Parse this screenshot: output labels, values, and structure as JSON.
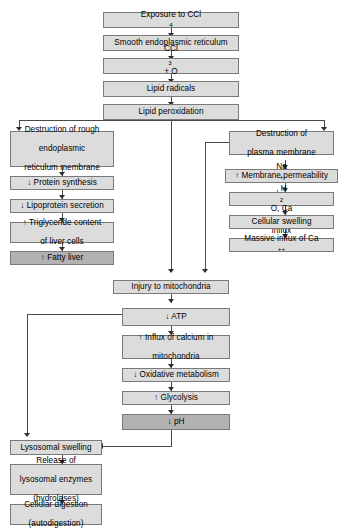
{
  "diagram": {
    "colors": {
      "box_fill": "#dcdcdc",
      "box_fill_highlight": "#b2b2b2",
      "box_border": "#7a7a7a",
      "connector": "#4a4a4a",
      "background": "#ffffff",
      "text": "#000000"
    },
    "nodes": {
      "exposure": {
        "label": "Exposure to CCl",
        "sub": "4",
        "highlight": false
      },
      "smooth_er": {
        "label": "Smooth endoplasmic reticulum",
        "highlight": false
      },
      "ccl3_radical": {
        "pre": "CCl",
        "sub1": "3",
        "radical": "˙",
        "mid": " + O",
        "sub2": "2",
        "highlight": false
      },
      "lipid_radicals": {
        "label": "Lipid radicals",
        "highlight": false
      },
      "lipid_peroxidation": {
        "label": "Lipid peroxidation",
        "highlight": false
      },
      "destruction_rough_er": {
        "line1": "Destruction of rough",
        "line2": "endoplasmic",
        "line3": "reticulum membrane",
        "highlight": false
      },
      "protein_synthesis": {
        "label": "↓ Protein synthesis",
        "highlight": false
      },
      "lipoprotein_secretion": {
        "label": "↓ Lipoprotein secretion",
        "highlight": false
      },
      "triglyceride_content": {
        "line1": "↑ Triglyceride content",
        "line2": "of liver cells",
        "highlight": false
      },
      "fatty_liver": {
        "label": "↑ Fatty liver",
        "highlight": true
      },
      "destruction_plasma_membrane": {
        "line1": "Destruction of",
        "line2": "plasma membrane",
        "highlight": false
      },
      "membrane_permeability": {
        "label": "↑ Membrane permeability",
        "highlight": false
      },
      "ion_influx": {
        "pre": "Na",
        "sup1": "+",
        "mid1": ", H",
        "sub1": "2",
        "mid2": "O, Ca",
        "sup2": "++",
        "post": " influx",
        "highlight": false
      },
      "cellular_swelling": {
        "label": "Cellular swelling",
        "highlight": false
      },
      "massive_calcium_influx": {
        "pre": "Massive influx of Ca",
        "sup": "++",
        "highlight": false
      },
      "injury_mitochondria": {
        "label": "Injury to mitochondria",
        "highlight": false
      },
      "atp": {
        "label": "↓ ATP",
        "highlight": false
      },
      "calcium_influx_mito": {
        "line1": "↑ Influx of calcium in",
        "line2": "mitochondria",
        "highlight": false
      },
      "oxidative_metabolism": {
        "label": "↓ Oxidative metabolism",
        "highlight": false
      },
      "glycolysis": {
        "label": "↑ Glycolysis",
        "highlight": false
      },
      "ph": {
        "label": "↓ pH",
        "highlight": true
      },
      "lysosomal_swelling": {
        "label": "Lysosomal swelling",
        "highlight": false
      },
      "lysosomal_enzymes": {
        "line1": "Release of",
        "line2": "lysosomal enzymes",
        "line3": "(hydrolases)",
        "highlight": false
      },
      "cellular_digestion": {
        "line1": "Cellular digestion",
        "line2": "(autodigestion)",
        "highlight": false
      }
    }
  }
}
